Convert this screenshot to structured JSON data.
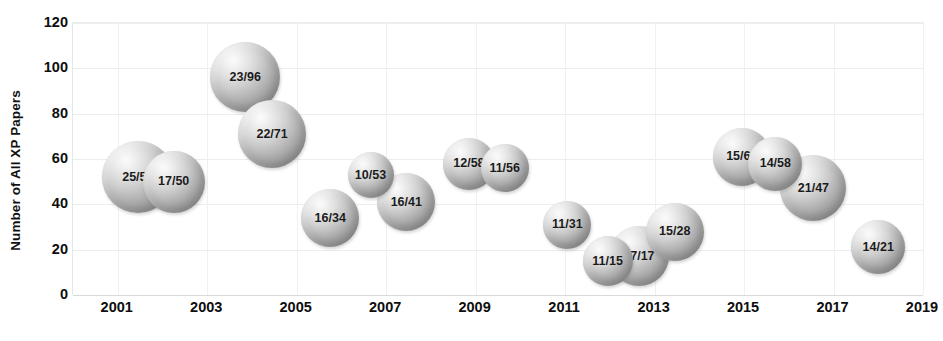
{
  "chart_data": {
    "type": "scatter",
    "title": "",
    "xlabel": "",
    "ylabel": "Number of All XP Papers",
    "xlim": [
      2000,
      2019
    ],
    "ylim": [
      0,
      120
    ],
    "grid": true,
    "legend": "none",
    "x_ticks": [
      "2001",
      "2003",
      "2005",
      "2007",
      "2009",
      "2011",
      "2013",
      "2015",
      "2017",
      "2019"
    ],
    "x_tick_values": [
      2001,
      2003,
      2005,
      2007,
      2009,
      2011,
      2013,
      2015,
      2017,
      2019
    ],
    "y_ticks": [
      "0",
      "20",
      "40",
      "60",
      "80",
      "100",
      "120"
    ],
    "y_tick_values": [
      0,
      20,
      40,
      60,
      80,
      100,
      120
    ],
    "bubbles": [
      {
        "label": "25/52",
        "x": 2001.45,
        "y": 52,
        "size": 25,
        "r": 36
      },
      {
        "label": "17/50",
        "x": 2002.25,
        "y": 50,
        "size": 17,
        "r": 31
      },
      {
        "label": "23/96",
        "x": 2003.85,
        "y": 96,
        "size": 23,
        "r": 35
      },
      {
        "label": "22/71",
        "x": 2004.45,
        "y": 71,
        "size": 22,
        "r": 34
      },
      {
        "label": "16/34",
        "x": 2005.75,
        "y": 34,
        "size": 16,
        "r": 29
      },
      {
        "label": "10/53",
        "x": 2006.65,
        "y": 53,
        "size": 10,
        "r": 23
      },
      {
        "label": "16/41",
        "x": 2007.45,
        "y": 41,
        "size": 16,
        "r": 29
      },
      {
        "label": "12/58",
        "x": 2008.85,
        "y": 58,
        "size": 12,
        "r": 26
      },
      {
        "label": "11/56",
        "x": 2009.65,
        "y": 56,
        "size": 11,
        "r": 24
      },
      {
        "label": "11/31",
        "x": 2011.05,
        "y": 31,
        "size": 11,
        "r": 24
      },
      {
        "label": "11/15",
        "x": 2011.95,
        "y": 15,
        "size": 11,
        "r": 25
      },
      {
        "label": "17/17",
        "x": 2012.65,
        "y": 17,
        "size": 17,
        "r": 30
      },
      {
        "label": "15/28",
        "x": 2013.45,
        "y": 28,
        "size": 15,
        "r": 29
      },
      {
        "label": "15/61",
        "x": 2014.95,
        "y": 61,
        "size": 15,
        "r": 29
      },
      {
        "label": "14/58",
        "x": 2015.7,
        "y": 58,
        "size": 14,
        "r": 27
      },
      {
        "label": "21/47",
        "x": 2016.55,
        "y": 47,
        "size": 21,
        "r": 33
      },
      {
        "label": "14/21",
        "x": 2018.0,
        "y": 21,
        "size": 14,
        "r": 27
      }
    ]
  },
  "colors": {
    "background": "#ffffff",
    "gridline": "#ededed",
    "axis_text": "#0d0d0d",
    "bubble_light": "#fbfbfb",
    "bubble_mid": "#b9b9b9",
    "bubble_dark": "#8e8e8e",
    "bubble_label": "#1a1a1a"
  }
}
